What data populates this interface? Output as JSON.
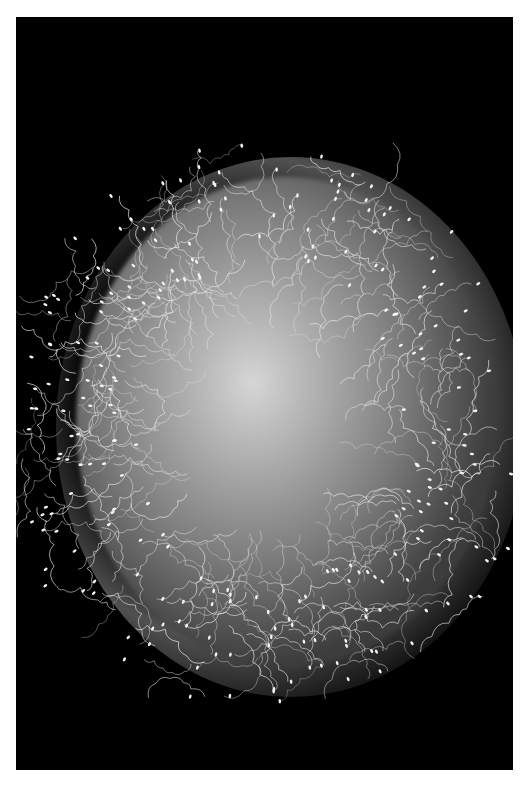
{
  "image": {
    "subject": "sperm cells surrounding an egg cell",
    "style": "black and white micrograph",
    "background_color": "#000000",
    "border_color": "#ffffff",
    "egg_color": "#b0b0b0",
    "sperm_color": "#e8e8e8"
  }
}
